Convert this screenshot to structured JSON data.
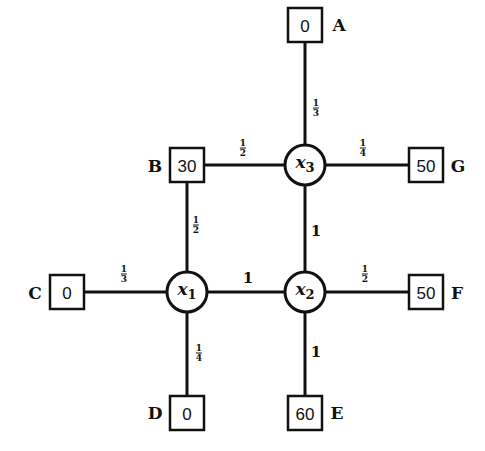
{
  "diagram": {
    "type": "network",
    "variable_nodes": [
      {
        "id": "x1",
        "symbol": "x",
        "sub": "1"
      },
      {
        "id": "x2",
        "symbol": "x",
        "sub": "2"
      },
      {
        "id": "x3",
        "symbol": "x",
        "sub": "3"
      }
    ],
    "boundary_nodes": [
      {
        "id": "A",
        "label": "A",
        "value": "0"
      },
      {
        "id": "B",
        "label": "B",
        "value": "30"
      },
      {
        "id": "C",
        "label": "C",
        "value": "0"
      },
      {
        "id": "D",
        "label": "D",
        "value": "0"
      },
      {
        "id": "E",
        "label": "E",
        "value": "60"
      },
      {
        "id": "F",
        "label": "F",
        "value": "50"
      },
      {
        "id": "G",
        "label": "G",
        "value": "50"
      }
    ],
    "edges": [
      {
        "from": "A",
        "to": "x3",
        "weight_num": "1",
        "weight_den": "3"
      },
      {
        "from": "B",
        "to": "x3",
        "weight_num": "1",
        "weight_den": "2"
      },
      {
        "from": "x3",
        "to": "G",
        "weight_num": "1",
        "weight_den": "4"
      },
      {
        "from": "B",
        "to": "x1",
        "weight_num": "1",
        "weight_den": "2"
      },
      {
        "from": "x3",
        "to": "x2",
        "weight": "1"
      },
      {
        "from": "C",
        "to": "x1",
        "weight_num": "1",
        "weight_den": "3"
      },
      {
        "from": "x1",
        "to": "x2",
        "weight": "1"
      },
      {
        "from": "x2",
        "to": "F",
        "weight_num": "1",
        "weight_den": "2"
      },
      {
        "from": "x1",
        "to": "D",
        "weight_num": "1",
        "weight_den": "4"
      },
      {
        "from": "x2",
        "to": "E",
        "weight": "1"
      }
    ]
  }
}
